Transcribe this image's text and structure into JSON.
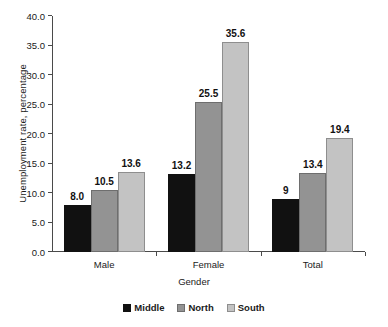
{
  "chart_data": {
    "type": "bar",
    "title": "",
    "xlabel": "Gender",
    "ylabel": "Unemployment rate, percentage",
    "categories": [
      "Male",
      "Female",
      "Total"
    ],
    "series": [
      {
        "name": "Middle",
        "color": "#111111",
        "values": [
          8.0,
          13.2,
          9.0
        ],
        "labels": [
          "8.0",
          "13.2",
          "9"
        ]
      },
      {
        "name": "North",
        "color": "#939393",
        "values": [
          10.5,
          25.5,
          13.4
        ],
        "labels": [
          "10.5",
          "25.5",
          "13.4"
        ]
      },
      {
        "name": "South",
        "color": "#c3c3c3",
        "values": [
          13.6,
          35.6,
          19.4
        ],
        "labels": [
          "13.6",
          "35.6",
          "19.4"
        ]
      }
    ],
    "ylim": [
      0.0,
      40.0
    ],
    "ytick_values": [
      0.0,
      5.0,
      10.0,
      15.0,
      20.0,
      25.0,
      30.0,
      35.0,
      40.0
    ],
    "ytick_labels": [
      "0.0",
      "5.0",
      "10.0",
      "15.0",
      "20.0",
      "25.0",
      "30.0",
      "35.0",
      "40.0"
    ],
    "grid": false,
    "legend_position": "bottom"
  },
  "axis": {
    "y_title": "Unemployment rate, percentage",
    "x_title": "Gender"
  }
}
